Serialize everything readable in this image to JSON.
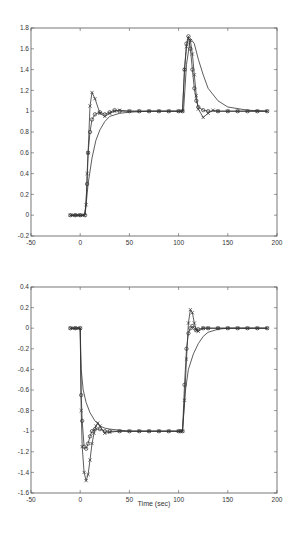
{
  "chart_data": [
    {
      "type": "line",
      "title": "",
      "xlabel": "",
      "ylabel": "",
      "xlim": [
        -50,
        200
      ],
      "ylim": [
        -0.2,
        1.8
      ],
      "xticks": [
        -50,
        0,
        50,
        100,
        150,
        200
      ],
      "yticks": [
        -0.2,
        0,
        0.2,
        0.4,
        0.6,
        0.8,
        1,
        1.2,
        1.4,
        1.6,
        1.8
      ],
      "grid": false,
      "legend": null,
      "series": [
        {
          "name": "solid-smooth",
          "marker": "none",
          "x": [
            -10,
            5,
            8,
            12,
            16,
            20,
            25,
            30,
            40,
            50,
            70,
            100,
            105,
            108,
            112,
            116,
            120,
            125,
            130,
            140,
            150,
            170,
            190
          ],
          "y": [
            0,
            0,
            0.3,
            0.55,
            0.72,
            0.82,
            0.9,
            0.95,
            0.98,
            0.99,
            1,
            1,
            1,
            1.45,
            1.7,
            1.65,
            1.5,
            1.35,
            1.22,
            1.1,
            1.04,
            1.01,
            1
          ]
        },
        {
          "name": "x-marker",
          "marker": "x",
          "x": [
            -10,
            -8,
            -6,
            -4,
            -2,
            0,
            2,
            4,
            6,
            7,
            8,
            10,
            12,
            15,
            20,
            25,
            30,
            35,
            40,
            50,
            60,
            70,
            80,
            90,
            100,
            102,
            104,
            106,
            108,
            110,
            112,
            114,
            116,
            118,
            120,
            125,
            130,
            135,
            140,
            150,
            160,
            170,
            180,
            190
          ],
          "y": [
            0,
            0,
            0,
            0,
            0,
            0,
            0,
            0,
            0.1,
            0.4,
            0.6,
            1.05,
            1.18,
            1.12,
            0.98,
            0.95,
            0.98,
            1.0,
            1.01,
            1,
            1,
            1,
            1,
            1,
            1,
            1,
            1,
            1.4,
            1.62,
            1.7,
            1.68,
            1.55,
            1.35,
            1.15,
            1.02,
            0.94,
            0.98,
            1.01,
            1.0,
            1,
            1,
            1,
            1,
            1
          ]
        },
        {
          "name": "o-marker",
          "marker": "o",
          "x": [
            -10,
            -5,
            0,
            5,
            7,
            8,
            10,
            12,
            15,
            20,
            25,
            30,
            35,
            40,
            50,
            60,
            70,
            80,
            90,
            100,
            104,
            106,
            108,
            110,
            112,
            114,
            116,
            118,
            120,
            125,
            130,
            140,
            150,
            160,
            170,
            180,
            190
          ],
          "y": [
            0,
            0,
            0,
            0,
            0.3,
            0.6,
            0.8,
            0.92,
            0.97,
            0.99,
            0.97,
            0.99,
            1.01,
            1.0,
            1,
            1,
            1,
            1,
            1,
            1,
            1,
            1.4,
            1.65,
            1.72,
            1.6,
            1.4,
            1.22,
            1.1,
            1.04,
            1.01,
            1.0,
            1,
            1,
            1,
            1,
            1,
            1
          ]
        }
      ]
    },
    {
      "type": "line",
      "title": "",
      "xlabel": "Time (sec)",
      "ylabel": "",
      "xlim": [
        -50,
        200
      ],
      "ylim": [
        -1.6,
        0.4
      ],
      "xticks": [
        -50,
        0,
        50,
        100,
        150,
        200
      ],
      "yticks": [
        -1.6,
        -1.4,
        -1.2,
        -1,
        -0.8,
        -0.6,
        -0.4,
        -0.2,
        0,
        0.2,
        0.4
      ],
      "grid": false,
      "legend": null,
      "series": [
        {
          "name": "solid-smooth",
          "marker": "none",
          "x": [
            -10,
            0,
            1,
            3,
            6,
            10,
            15,
            20,
            25,
            30,
            40,
            50,
            70,
            100,
            104,
            107,
            110,
            115,
            120,
            125,
            130,
            140,
            150,
            170,
            190
          ],
          "y": [
            0,
            0,
            -0.4,
            -0.6,
            -0.72,
            -0.82,
            -0.9,
            -0.95,
            -0.97,
            -0.98,
            -0.99,
            -1,
            -1,
            -1,
            -1,
            -0.6,
            -0.4,
            -0.25,
            -0.15,
            -0.08,
            -0.04,
            -0.01,
            0,
            0,
            0
          ]
        },
        {
          "name": "x-marker",
          "marker": "x",
          "x": [
            -10,
            -8,
            -6,
            -4,
            -2,
            0,
            1,
            2,
            4,
            6,
            8,
            10,
            12,
            14,
            16,
            18,
            20,
            25,
            30,
            40,
            50,
            60,
            70,
            80,
            90,
            100,
            102,
            104,
            106,
            108,
            110,
            112,
            114,
            116,
            118,
            120,
            125,
            130,
            140,
            150,
            160,
            170,
            180,
            190
          ],
          "y": [
            0,
            0,
            0,
            0,
            0,
            0,
            -0.8,
            -1.15,
            -1.4,
            -1.48,
            -1.42,
            -1.28,
            -1.12,
            -1.02,
            -0.95,
            -0.92,
            -0.95,
            -1.02,
            -1.01,
            -1.0,
            -1,
            -1,
            -1,
            -1,
            -1,
            -1,
            -1,
            -1,
            -0.7,
            -0.3,
            0.05,
            0.18,
            0.15,
            0.05,
            -0.02,
            -0.03,
            0.0,
            0.0,
            0,
            0,
            0,
            0,
            0,
            0
          ]
        },
        {
          "name": "o-marker",
          "marker": "o",
          "x": [
            -10,
            -5,
            0,
            1,
            2,
            4,
            6,
            8,
            10,
            12,
            15,
            20,
            25,
            30,
            40,
            50,
            60,
            70,
            80,
            90,
            100,
            102,
            104,
            106,
            108,
            110,
            112,
            114,
            116,
            118,
            120,
            125,
            130,
            140,
            150,
            160,
            170,
            180,
            190
          ],
          "y": [
            0,
            0,
            0,
            -0.65,
            -0.9,
            -1.15,
            -1.17,
            -1.12,
            -1.05,
            -1.0,
            -0.98,
            -0.98,
            -1.0,
            -1.0,
            -1.0,
            -1,
            -1,
            -1,
            -1,
            -1,
            -1,
            -1,
            -1,
            -0.55,
            -0.2,
            -0.05,
            0.0,
            0.02,
            0.0,
            -0.02,
            -0.01,
            0.0,
            0,
            0,
            0,
            0,
            0,
            0,
            0
          ]
        }
      ]
    }
  ],
  "plots": [
    {
      "xtick_labels": [
        "-50",
        "0",
        "50",
        "100",
        "150",
        "200"
      ],
      "ytick_labels": [
        "-0.2",
        "0",
        "0.2",
        "0.4",
        "0.6",
        "0.8",
        "1",
        "1.2",
        "1.4",
        "1.6",
        "1.8"
      ]
    },
    {
      "xtick_labels": [
        "-50",
        "0",
        "50",
        "100",
        "150",
        "200"
      ],
      "ytick_labels": [
        "-1.6",
        "-1.4",
        "-1.2",
        "-1",
        "-0.8",
        "-0.6",
        "-0.4",
        "-0.2",
        "0",
        "0.2",
        "0.4"
      ],
      "xlabel": "Time (sec)"
    }
  ],
  "colors": {
    "axis": "#555555",
    "line": "#333333",
    "background": "#ffffff"
  }
}
